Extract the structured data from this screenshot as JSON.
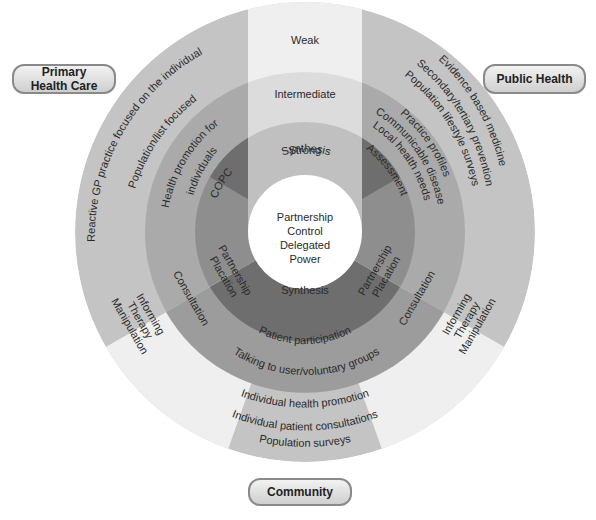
{
  "categories": {
    "primary_health_care": "Primary Health Care",
    "public_health": "Public Health",
    "community": "Community"
  },
  "strength_levels": {
    "weak": "Weak",
    "intermediate": "Intermediate",
    "strong": "Strong"
  },
  "center": {
    "synthesis_top": "Synthesis",
    "synthesis_bottom": "Synthesis",
    "lines": [
      "Partnership",
      "Control",
      "Delegated",
      "Power"
    ]
  },
  "primary_health_care_rings": {
    "outer": "Reactive GP practice focused on the individual",
    "middle": "Population/list focused",
    "inner_1": "Health promotion for",
    "inner_2": "individuals",
    "core": "COPC"
  },
  "public_health_rings": {
    "outer": [
      "Evidence based medicine",
      "Secondary/tertiary prevention",
      "Population lifestyle surveys"
    ],
    "middle": [
      "Practice profiles",
      "Communicable disease",
      "Local health needs"
    ],
    "core": "Assessment"
  },
  "community_rings": {
    "outer": [
      "Individual health promotion",
      "Individual patient consultations",
      "Population surveys"
    ],
    "middle": "Talking to user/voluntary groups",
    "core": "Patient participation"
  },
  "left_lower": {
    "inner": [
      "Partnership",
      "Placation"
    ],
    "middle": "Consultation",
    "outer": [
      "Informing",
      "Therapy",
      "Manipulation"
    ]
  },
  "right_lower": {
    "inner": [
      "Partnership",
      "Placation"
    ],
    "middle": "Consultation",
    "outer": [
      "Informing",
      "Therapy",
      "Manipulation"
    ]
  },
  "colors": {
    "outer_ring": "#c4c4c4",
    "middle_ring": "#aaaaaa",
    "inner_ring": "#8e8e8e",
    "core_ring": "#6e6e6e",
    "weak_strip": "#eeeeee",
    "intermediate_strip": "#dcdcdc",
    "strong_strip": "#c0c0c0"
  }
}
